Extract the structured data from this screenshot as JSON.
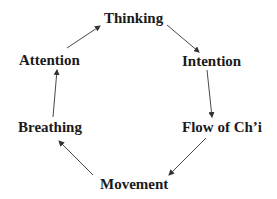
{
  "diagram": {
    "type": "cycle",
    "direction": "clockwise",
    "nodes": [
      {
        "id": "thinking",
        "label": "Thinking"
      },
      {
        "id": "intention",
        "label": "Intention"
      },
      {
        "id": "flow",
        "label": "Flow of Ch’i"
      },
      {
        "id": "movement",
        "label": "Movement"
      },
      {
        "id": "breathing",
        "label": "Breathing"
      },
      {
        "id": "attention",
        "label": "Attention"
      }
    ],
    "edges": [
      {
        "from": "thinking",
        "to": "intention"
      },
      {
        "from": "intention",
        "to": "flow"
      },
      {
        "from": "flow",
        "to": "movement"
      },
      {
        "from": "movement",
        "to": "breathing"
      },
      {
        "from": "breathing",
        "to": "attention"
      },
      {
        "from": "attention",
        "to": "thinking"
      }
    ],
    "colors": {
      "text": "#1a1a1a",
      "arrow": "#333333",
      "background": "#ffffff"
    }
  }
}
